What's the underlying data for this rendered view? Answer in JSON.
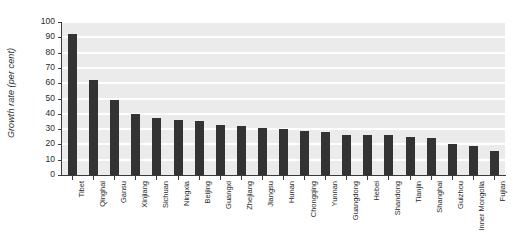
{
  "chart_data": {
    "type": "bar",
    "title": "",
    "subtitle": "",
    "xlabel": "",
    "ylabel": "Growth rate (per cent)",
    "ylim": [
      0,
      100
    ],
    "yticks": [
      0,
      10,
      20,
      30,
      40,
      50,
      60,
      70,
      80,
      90,
      100
    ],
    "grid": "horizontal",
    "legend": "none",
    "orientation": "vertical",
    "bar_color": "#333333",
    "plot_background": "#ebebeb",
    "gridline_color": "#ffffff",
    "axis_color": "#3a3a3a",
    "categories": [
      "Tibet",
      "Qinghai",
      "Gansu",
      "Xinjiang",
      "Sichuan",
      "Ningxia",
      "Beijing",
      "Guangxi",
      "Zhejiang",
      "Jiangsu",
      "Hunan",
      "Chongqing",
      "Yunnan",
      "Guangdong",
      "Hebei",
      "Shandong",
      "Tianjin",
      "Shanghai",
      "Guizhou",
      "Inner Mongolia",
      "Fujian"
    ],
    "values": [
      92,
      62,
      49,
      40,
      37,
      36,
      35,
      33,
      32,
      31,
      30,
      29,
      28,
      26,
      26,
      26,
      25,
      24,
      20,
      19,
      16
    ]
  }
}
